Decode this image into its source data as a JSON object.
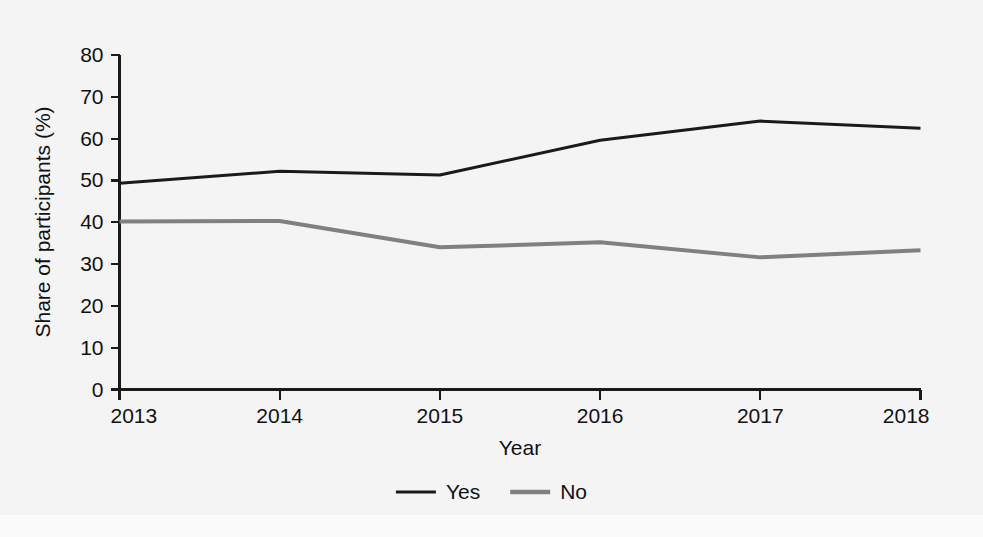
{
  "chart_data": {
    "type": "line",
    "title": "",
    "xlabel": "Year",
    "ylabel": "Share of participants (%)",
    "categories": [
      "2013",
      "2014",
      "2015",
      "2016",
      "2017",
      "2018"
    ],
    "x": [
      2013,
      2014,
      2015,
      2016,
      2017,
      2018
    ],
    "xlim": [
      2013,
      2018
    ],
    "ylim": [
      0,
      80
    ],
    "yticks": [
      0,
      10,
      20,
      30,
      40,
      50,
      60,
      70,
      80
    ],
    "ytick_labels": [
      "0",
      "10",
      "20",
      "30",
      "40",
      "50",
      "60",
      "70",
      "80"
    ],
    "xtick_labels": [
      "2013",
      "2014",
      "2015",
      "2016",
      "2017",
      "2018"
    ],
    "grid": false,
    "legend_position": "bottom-center",
    "series": [
      {
        "name": "Yes",
        "color": "#1a1a1a",
        "values": [
          49.3,
          52.2,
          51.3,
          59.6,
          64.2,
          62.5
        ]
      },
      {
        "name": "No",
        "color": "#808080",
        "values": [
          40.2,
          40.3,
          34.0,
          35.2,
          31.6,
          33.3
        ]
      }
    ]
  },
  "legend": {
    "items": [
      {
        "label": "Yes",
        "color": "#1a1a1a"
      },
      {
        "label": "No",
        "color": "#808080"
      }
    ]
  },
  "axes": {
    "y_title": "Share of participants (%)",
    "x_title": "Year"
  },
  "colors": {
    "background": "#f4f4f4",
    "axis": "#1a1a1a",
    "series_yes": "#1a1a1a",
    "series_no": "#808080"
  }
}
